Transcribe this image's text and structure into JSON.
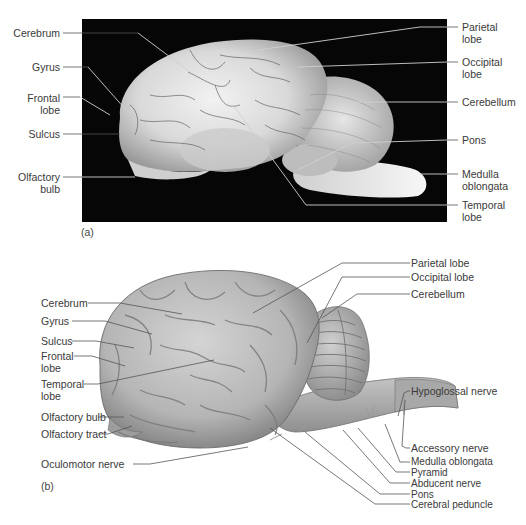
{
  "panel_a": {
    "tag": "(a)",
    "description": "Photograph of preserved sheep brain, lateral view",
    "labels_left": [
      {
        "id": "cerebrum",
        "text": "Cerebrum"
      },
      {
        "id": "gyrus",
        "text": "Gyrus"
      },
      {
        "id": "frontal-lobe",
        "text": "Frontal\nlobe"
      },
      {
        "id": "sulcus",
        "text": "Sulcus"
      },
      {
        "id": "olfactory-bulb",
        "text": "Olfactory\nbulb"
      }
    ],
    "labels_right": [
      {
        "id": "parietal-lobe",
        "text": "Parietal\nlobe"
      },
      {
        "id": "occipital-lobe",
        "text": "Occipital\nlobe"
      },
      {
        "id": "cerebellum",
        "text": "Cerebellum"
      },
      {
        "id": "pons",
        "text": "Pons"
      },
      {
        "id": "medulla-oblongata",
        "text": "Medulla\noblongata"
      },
      {
        "id": "temporal-lobe",
        "text": "Temporal\nlobe"
      }
    ]
  },
  "panel_b": {
    "tag": "(b)",
    "description": "Illustration of sheep brain, lateral view",
    "labels_left": [
      {
        "id": "cerebrum",
        "text": "Cerebrum"
      },
      {
        "id": "gyrus",
        "text": "Gyrus"
      },
      {
        "id": "sulcus",
        "text": "Sulcus"
      },
      {
        "id": "frontal-lobe",
        "text": "Frontal\nlobe"
      },
      {
        "id": "temporal-lobe",
        "text": "Temporal\nlobe"
      },
      {
        "id": "olfactory-bulb",
        "text": "Olfactory bulb"
      },
      {
        "id": "olfactory-tract",
        "text": "Olfactory tract"
      },
      {
        "id": "oculomotor-nerve",
        "text": "Oculomotor nerve"
      }
    ],
    "labels_right": [
      {
        "id": "parietal-lobe",
        "text": "Parietal lobe"
      },
      {
        "id": "occipital-lobe",
        "text": "Occipital lobe"
      },
      {
        "id": "cerebellum",
        "text": "Cerebellum"
      },
      {
        "id": "hypoglossal-nerve",
        "text": "Hypoglossal nerve"
      },
      {
        "id": "accessory-nerve",
        "text": "Accessory nerve"
      },
      {
        "id": "medulla-oblongata",
        "text": "Medulla oblongata"
      },
      {
        "id": "pyramid",
        "text": "Pyramid"
      },
      {
        "id": "abducent-nerve",
        "text": "Abducent nerve"
      },
      {
        "id": "pons",
        "text": "Pons"
      },
      {
        "id": "cerebral-peduncle",
        "text": "Cerebral peduncle"
      }
    ]
  }
}
